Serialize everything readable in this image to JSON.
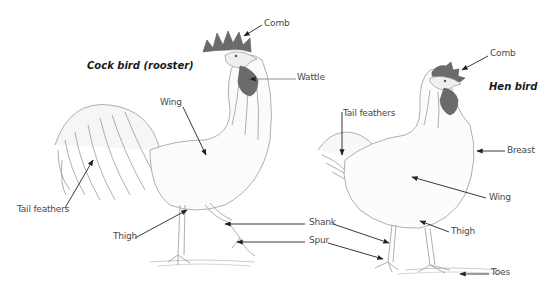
{
  "diagram": {
    "type": "labeled-illustration",
    "rooster": {
      "title": "Cock bird (rooster)",
      "labels": {
        "comb": "Comb",
        "wattle": "Wattle",
        "wing": "Wing",
        "tail_feathers": "Tail feathers",
        "thigh": "Thigh"
      }
    },
    "shared": {
      "shank": "Shank",
      "spur": "Spur"
    },
    "hen": {
      "title": "Hen bird",
      "labels": {
        "comb": "Comb",
        "tail_feathers": "Tail feathers",
        "breast": "Breast",
        "wing": "Wing",
        "thigh": "Thigh",
        "toes": "Toes"
      }
    },
    "colors": {
      "comb_wattle": "#6b6b6b",
      "line_art": "#9a9a9a",
      "arrow": "#222222",
      "label_text": "#4a4a4a"
    }
  }
}
